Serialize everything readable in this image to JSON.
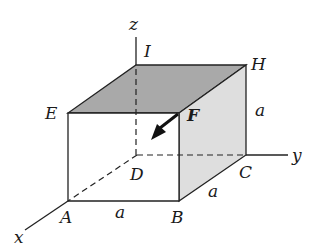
{
  "diagram": {
    "type": "3d-cube-force",
    "colors": {
      "top_face": "#a9a9a9",
      "right_face": "#dedede",
      "edges": "#222222",
      "background": "#ffffff"
    },
    "axes": {
      "x": "x",
      "y": "y",
      "z": "z"
    },
    "vertices": {
      "A": "A",
      "B": "B",
      "C": "C",
      "D": "D",
      "E": "E",
      "F": "F",
      "H": "H",
      "I": "I"
    },
    "dimensions": {
      "AB": "a",
      "BC": "a",
      "CH": "a"
    },
    "force": {
      "label": "F",
      "from": "F",
      "toward": "D"
    }
  }
}
